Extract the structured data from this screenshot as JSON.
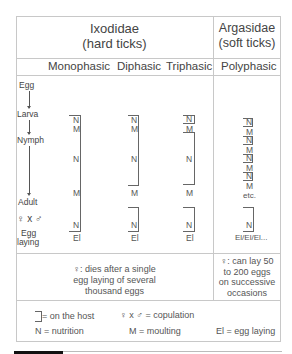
{
  "header": {
    "ixodidae": {
      "name": "Ixodidae",
      "sub": "(hard ticks)"
    },
    "argasidae": {
      "name": "Argasidae",
      "sub": "(soft ticks)"
    }
  },
  "columns": [
    "Monophasic",
    "Diphasic",
    "Triphasic",
    "Polyphasic"
  ],
  "stages": [
    "Egg",
    "Larva",
    "Nymph",
    "Adult",
    "♀ x ♂",
    "Egg",
    "laying"
  ],
  "monophasic": {
    "labels": [
      "N",
      "M",
      "N",
      "M",
      "N"
    ],
    "end": "El"
  },
  "diphasic": {
    "labels": [
      "N",
      "M",
      "N",
      "M",
      "N"
    ],
    "end": "El"
  },
  "triphasic": {
    "labels": [
      "N",
      "M",
      "N",
      "M",
      "N"
    ],
    "end": "El"
  },
  "polyphasic": {
    "labels": [
      "N",
      "M",
      "N",
      "M",
      "N",
      "M",
      "N",
      "M",
      "etc.",
      "N"
    ],
    "end": "El/El/El..."
  },
  "notes": {
    "ixodidae": [
      "♀:   dies after a single",
      "egg laying of several",
      "thousand eggs"
    ],
    "argasidae": [
      "♀:  can lay 50",
      "to 200 eggs",
      "on successive",
      "occasions"
    ]
  },
  "legend": {
    "host": "= on the host",
    "copulation": "♀ x ♂ = copulation",
    "nutrition": "N = nutrition",
    "moulting": "M = moulting",
    "egg_laying": "El = egg laying"
  }
}
